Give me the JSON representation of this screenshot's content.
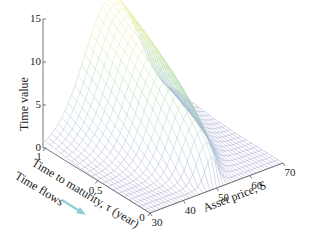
{
  "chart_data": {
    "type": "surface3d",
    "title": "",
    "zlabel": "Time value",
    "xlabel": "Asset price, S",
    "ylabel": "Time to maturity, τ (year)",
    "annotation": "Time flows",
    "annotation_arrow_color": "#8ecfd6",
    "x_ticks": [
      30,
      40,
      50,
      60,
      70
    ],
    "y_ticks": [
      0,
      0.5,
      1
    ],
    "y_tick_labels": [
      "0",
      "0.5",
      "1"
    ],
    "z_ticks": [
      0,
      5,
      10,
      15
    ],
    "xlim": [
      30,
      70
    ],
    "ylim": [
      0,
      1
    ],
    "zlim": [
      0,
      15
    ],
    "strike": 50,
    "peak_time_value": 14.2,
    "grid_x_count": 41,
    "grid_y_count": 21,
    "colormap": [
      "#9ea0c8",
      "#a8c9d6",
      "#a9d8b0",
      "#d6e8a0",
      "#f0ec9a"
    ],
    "sample_surface": {
      "S": [
        30,
        40,
        50,
        60,
        70
      ],
      "tau_1.0": [
        1.2,
        5.5,
        14.2,
        5.6,
        1.6
      ],
      "tau_0.5": [
        0.3,
        3.0,
        10.0,
        3.2,
        0.5
      ],
      "tau_0.0": [
        0,
        0,
        0,
        0,
        0
      ]
    }
  },
  "labels": {
    "z_axis": "Time value",
    "tau_axis": "Time to maturity, τ (year)",
    "s_axis": "Asset price, S",
    "time_flows": "Time flows"
  }
}
